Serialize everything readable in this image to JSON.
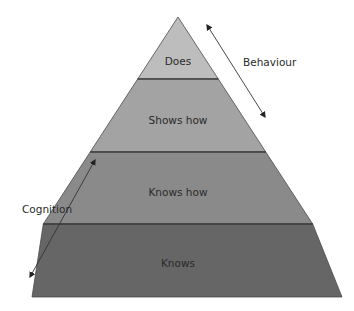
{
  "diagram": {
    "type": "pyramid",
    "levels": [
      {
        "label": "Does",
        "color": "#bdbdbd"
      },
      {
        "label": "Shows how",
        "color": "#a3a3a3"
      },
      {
        "label": "Knows how",
        "color": "#8a8a8a"
      },
      {
        "label": "Knows",
        "color": "#666666"
      }
    ],
    "arrows": [
      {
        "label": "Behaviour",
        "side": "right"
      },
      {
        "label": "Cognition",
        "side": "left"
      }
    ],
    "colors": {
      "outline": "#3a3a3a",
      "divider": "#2e2e2e",
      "arrow": "#333333"
    }
  }
}
